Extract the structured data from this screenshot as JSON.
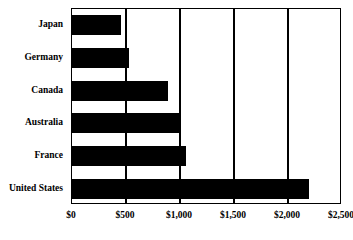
{
  "chart_data": {
    "type": "bar",
    "orientation": "horizontal",
    "title": "",
    "subtitle": "",
    "xlabel": "",
    "ylabel": "",
    "categories": [
      "Japan",
      "Germany",
      "Canada",
      "Australia",
      "France",
      "United States"
    ],
    "values": [
      450,
      530,
      890,
      1010,
      1060,
      2190
    ],
    "series": [
      {
        "name": "",
        "values": [
          450,
          530,
          890,
          1010,
          1060,
          2190
        ]
      }
    ],
    "xlim": [
      0,
      2500
    ],
    "xticks": [
      0,
      500,
      1000,
      1500,
      2000,
      2500
    ],
    "xtick_labels": [
      "$0",
      "$500",
      "$1,000",
      "$1,500",
      "$2,000",
      "$2,500"
    ],
    "grid": true,
    "grid_axis": "x",
    "legend": false,
    "legend_position": "none",
    "bar_color": "#000000",
    "frame_color": "#000000",
    "background_color": "#ffffff",
    "annotations": []
  }
}
